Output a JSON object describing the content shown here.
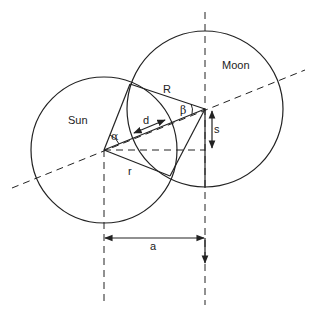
{
  "diagram": {
    "bodies": {
      "sun": {
        "label": "Sun",
        "cx": 104,
        "cy": 150,
        "r": 73
      },
      "moon": {
        "label": "Moon",
        "cx": 205,
        "cy": 109,
        "r": 78
      }
    },
    "intersections": {
      "upper": {
        "x": 130,
        "y": 84
      },
      "lower": {
        "x": 170,
        "y": 176
      }
    },
    "labels": {
      "R": "R",
      "r": "r",
      "d": "d",
      "s": "s",
      "a": "a",
      "alpha": "α",
      "beta": "β"
    },
    "colors": {
      "stroke": "#222222",
      "background": "#ffffff"
    }
  }
}
